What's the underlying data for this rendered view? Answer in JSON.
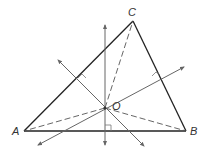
{
  "diagram": {
    "labels": {
      "A": "A",
      "B": "B",
      "C": "C",
      "O": "O"
    },
    "points": {
      "A": [
        24,
        131
      ],
      "B": [
        186,
        131
      ],
      "C": [
        133,
        21
      ],
      "O": [
        105,
        108
      ]
    },
    "colors": {
      "stroke": "#222222",
      "dashed": "#555555",
      "bisector": "#666666"
    }
  }
}
